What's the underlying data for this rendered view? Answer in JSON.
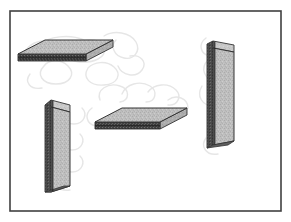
{
  "figure": {
    "background_color": "#ffffff",
    "frame": {
      "name": "figure-border",
      "x": 10,
      "y": 11,
      "width": 271,
      "height": 200,
      "stroke_color": "#3b3b3b",
      "stroke_width": 1.6,
      "fill": "none"
    },
    "palette": {
      "slab_face": "#b9b9b9",
      "slab_face_light": "#c9c9c9",
      "slab_face_dark": "#a8a8a8",
      "slab_edge_dark": "#3a3a3a",
      "slab_edge_mid": "#6d6d6d",
      "slab_outline": "#2e2e2e",
      "scribble": "#e6e6e6",
      "frame": "#3b3b3b",
      "paper": "#ffffff"
    },
    "scribbles": {
      "name": "background-scribbles",
      "color": "#e6e6e6",
      "stroke_width": 1.4,
      "description": "faint light-gray looping pencil scrawls behind the slabs",
      "paths": [
        "M22,58 C26,44 40,38 52,42 C62,45 60,56 50,58 C40,60 34,52 40,45 C48,36 70,34 84,40",
        "M44,66 C36,74 42,84 56,84 C70,84 76,74 68,66 C60,58 48,60 44,66",
        "M72,60 C68,48 80,38 94,40 C106,42 108,54 98,59 C88,64 76,62 72,60",
        "M88,68 C82,78 90,86 104,85 C118,84 122,74 114,67 C106,60 94,62 88,68",
        "M104,36 C114,30 130,32 136,42 C141,51 134,60 124,58 C114,56 110,46 116,40",
        "M118,66 C122,76 136,78 142,70 C148,62 140,54 130,56",
        "M30,74 C24,82 30,90 42,88",
        "M206,38 C198,44 200,54 210,56 C220,58 226,50 220,44",
        "M208,60 C200,68 204,80 216,80 C226,80 230,70 224,64",
        "M202,86 C196,96 202,106 214,106 C224,106 228,96 222,90",
        "M212,112 C204,120 208,132 220,132 C230,132 234,122 228,116",
        "M206,138 C200,146 206,156 218,154",
        "M66,104 C58,112 62,124 74,124 C84,124 88,114 82,108",
        "M60,128 C54,138 60,150 72,150 C82,150 86,140 80,134",
        "M64,152 C56,160 60,172 72,172 C82,172 86,162 80,156",
        "M58,174 C52,182 58,192 70,190",
        "M100,100 C96,90 108,82 120,86 C130,89 130,100 120,102",
        "M122,94 C126,84 140,80 150,86 C158,91 156,102 146,102",
        "M148,92 C154,84 168,82 176,90 C182,96 178,106 168,105",
        "M92,108 C84,114 86,124 96,126",
        "M168,100 C176,94 188,98 188,108"
      ]
    },
    "slabs": [
      {
        "id": 1,
        "name": "slab-top-left-horizontal",
        "orientation": "horizontal",
        "position": "top-left",
        "top_face": "18,54 45,40 113,40 86,54",
        "front_face": "18,54 86,54 86,61 18,61",
        "side_face": "86,54 113,40 113,47 86,61",
        "shadow_edge": "18,58 86,58 86,61 18,61"
      },
      {
        "id": 2,
        "name": "slab-right-vertical",
        "orientation": "vertical",
        "position": "right",
        "top_face": "213,41 234,45 234,52 213,48",
        "front_face": "213,41 213,145 207,148 207,44",
        "side_face": "213,48 234,52 234,141 213,145",
        "shadow_edge": "207,44 213,41 213,145 207,148"
      },
      {
        "id": 3,
        "name": "slab-bottom-left-vertical",
        "orientation": "vertical",
        "position": "bottom-left",
        "top_face": "51,100 70,105 70,112 51,107",
        "front_face": "51,100 51,186 45,192 45,105",
        "side_face": "51,107 70,112 70,186 51,192",
        "shadow_edge": "45,105 51,100 51,192 45,192"
      },
      {
        "id": 4,
        "name": "slab-middle-horizontal",
        "orientation": "horizontal",
        "position": "center-bottom",
        "top_face": "95,122 122,108 187,108 160,122",
        "front_face": "95,122 160,122 160,129 95,129",
        "side_face": "160,122 187,108 187,115 160,129",
        "shadow_edge": "95,126 160,126 160,129 95,129"
      }
    ]
  }
}
